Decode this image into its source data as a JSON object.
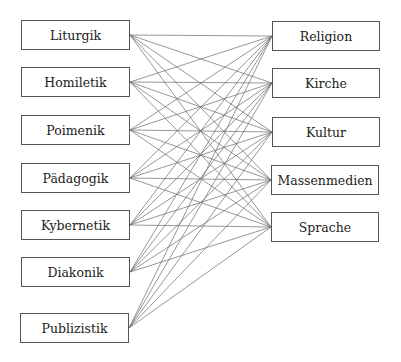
{
  "diagram": {
    "type": "bipartite-network",
    "left_nodes": [
      {
        "id": "liturgik",
        "label": "Liturgik",
        "x": 21,
        "y": 20,
        "w": 109,
        "h": 30
      },
      {
        "id": "homiletik",
        "label": "Homiletik",
        "x": 21,
        "y": 67,
        "w": 109,
        "h": 30
      },
      {
        "id": "poimenik",
        "label": "Poimenik",
        "x": 21,
        "y": 115,
        "w": 109,
        "h": 30
      },
      {
        "id": "paedagogik",
        "label": "Pädagogik",
        "x": 21,
        "y": 163,
        "w": 109,
        "h": 30
      },
      {
        "id": "kybernetik",
        "label": "Kybernetik",
        "x": 21,
        "y": 210,
        "w": 109,
        "h": 30
      },
      {
        "id": "diakonik",
        "label": "Diakonik",
        "x": 21,
        "y": 257,
        "w": 109,
        "h": 30
      },
      {
        "id": "publizistik",
        "label": "Publizistik",
        "x": 20,
        "y": 313,
        "w": 109,
        "h": 30
      }
    ],
    "right_nodes": [
      {
        "id": "religion",
        "label": "Religion",
        "x": 272,
        "y": 21,
        "w": 108,
        "h": 30
      },
      {
        "id": "kirche",
        "label": "Kirche",
        "x": 272,
        "y": 68,
        "w": 108,
        "h": 30
      },
      {
        "id": "kultur",
        "label": "Kultur",
        "x": 272,
        "y": 117,
        "w": 108,
        "h": 30
      },
      {
        "id": "massenmedien",
        "label": "Massenmedien",
        "x": 271,
        "y": 165,
        "w": 108,
        "h": 30
      },
      {
        "id": "sprache",
        "label": "Sprache",
        "x": 271,
        "y": 212,
        "w": 108,
        "h": 30
      }
    ],
    "edges": "all-to-all",
    "edge_color": "#6a6a6a",
    "edge_width": 0.7
  }
}
